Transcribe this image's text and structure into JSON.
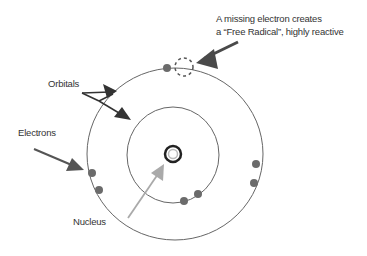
{
  "diagram": {
    "labels": {
      "free_radical_line1": "A missing electron creates",
      "free_radical_line2": "a “Free Radical”, highly reactive",
      "orbitals": "Orbitals",
      "electrons": "Electrons",
      "nucleus": "Nucleus"
    },
    "colors": {
      "orbit": "#666666",
      "electron": "#6b6b6b",
      "arrow_dark": "#4a4a4a",
      "arrow_light": "#aaaaaa",
      "text": "#333333"
    },
    "nodes": [
      {
        "id": "nucleus",
        "label": "Nucleus"
      },
      {
        "id": "inner_orbital",
        "label": "Orbital"
      },
      {
        "id": "outer_orbital",
        "label": "Orbital"
      },
      {
        "id": "missing_electron",
        "label": "Free Radical"
      }
    ],
    "electrons": {
      "inner_orbital_count": 2,
      "outer_orbital_count": 5,
      "missing": 1
    }
  }
}
